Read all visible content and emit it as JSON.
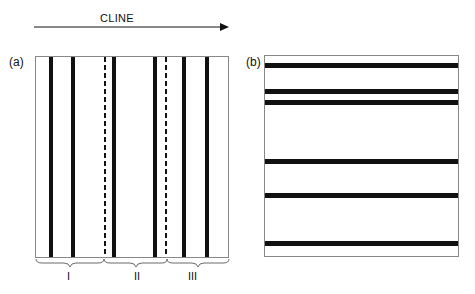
{
  "arrow": {
    "label": "CLINE"
  },
  "panels": {
    "a": {
      "label": "(a)",
      "solid_lines_x": [
        50,
        72,
        113,
        154,
        183,
        206
      ],
      "dashed_lines_x": [
        104,
        165
      ],
      "groups": [
        {
          "label": "I",
          "from": 36,
          "to": 105
        },
        {
          "label": "II",
          "from": 105,
          "to": 167
        },
        {
          "label": "III",
          "from": 167,
          "to": 229
        }
      ]
    },
    "b": {
      "label": "(b)",
      "lines_y": [
        65,
        91,
        102,
        161,
        195,
        243
      ]
    }
  },
  "colors": {
    "line": "#111111",
    "frame": "#888888"
  }
}
